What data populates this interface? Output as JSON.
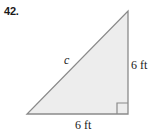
{
  "problem": {
    "number_label": "42."
  },
  "figure": {
    "name": "right-triangle-diagram",
    "shape": "right triangle",
    "fill_color": "#ededed",
    "stroke_color": "#8a8a8a",
    "background_color": "#ffffff",
    "vertices": {
      "apex": [
        128,
        11
      ],
      "bottom_left": [
        27,
        114
      ],
      "bottom_right": [
        128,
        114
      ]
    },
    "right_angle_marker": {
      "name": "right-angle-marker",
      "corner": "bottom-right",
      "size_px": 11
    },
    "labels": {
      "hypotenuse": "c",
      "vertical_leg": "6 ft",
      "horizontal_leg": "6 ft"
    }
  }
}
